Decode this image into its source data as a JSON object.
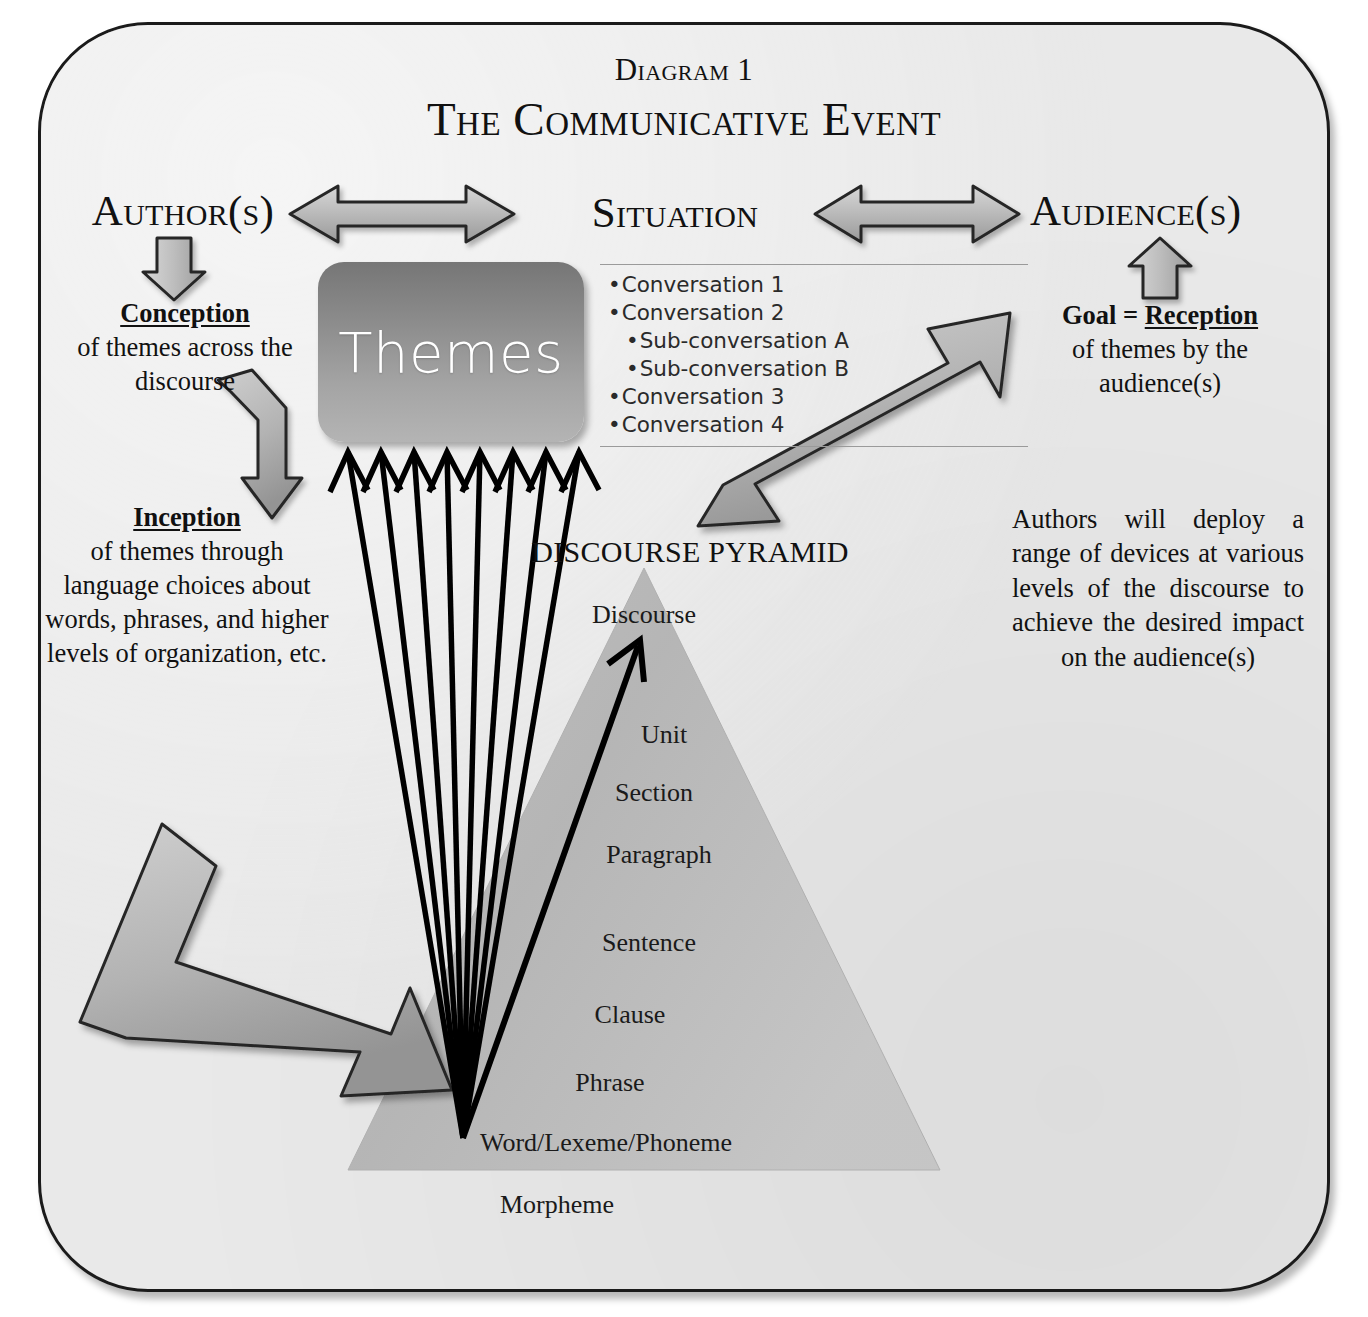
{
  "figure": {
    "number_label": "Diagram 1",
    "title": "The Communicative Event"
  },
  "columns": {
    "author_heading": "Author(s)",
    "situation_heading": "Situation",
    "audience_heading": "Audience(s)"
  },
  "left_column": {
    "conception": {
      "keyword": "Conception",
      "body": "of themes across the discourse"
    },
    "inception": {
      "keyword": "Inception",
      "body": "of themes through language choices about words, phrases, and higher levels of organization, etc."
    }
  },
  "right_column": {
    "goal": {
      "prefix": "Goal = ",
      "keyword": "Reception",
      "body": "of themes by the audience(s)"
    },
    "note": "Authors will deploy a range of devices at various levels of the discourse to achieve the desired impact on the audience(s)"
  },
  "situation_list": [
    {
      "text": "Conversation 1",
      "level": 1
    },
    {
      "text": "Conversation 2",
      "level": 1
    },
    {
      "text": "Sub-conversation A",
      "level": 2
    },
    {
      "text": "Sub-conversation B",
      "level": 2
    },
    {
      "text": "Conversation 3",
      "level": 1
    },
    {
      "text": "Conversation 4",
      "level": 1
    }
  ],
  "themes_box": {
    "label": "Themes"
  },
  "pyramid": {
    "title": "DISCOURSE PYRAMID",
    "levels": [
      "Discourse",
      "Unit",
      "Section",
      "Paragraph",
      "Sentence",
      "Clause",
      "Phrase",
      "Word/Lexeme/Phoneme",
      "Morpheme"
    ]
  },
  "colors": {
    "page_background": "#ffffff",
    "panel_background": "#e9e9e9",
    "frame_stroke": "#1b1b1b",
    "arrow_fill_light": "#c2c2c2",
    "arrow_fill_dark": "#8f8f8f",
    "arrow_stroke": "#262626",
    "pyramid_fill": "#b7b7b7",
    "themes_top": "#767676",
    "themes_bottom": "#b4b4b4",
    "thin_arrow": "#000000",
    "rule_line": "#9a9a9a"
  },
  "icons": {
    "double_arrow_left": "double-headed-arrow-icon",
    "double_arrow_right": "double-headed-arrow-icon",
    "author_down_arrow": "down-arrow-icon",
    "audience_up_arrow": "up-arrow-icon",
    "conception_bent_arrow": "bent-arrow-icon",
    "inception_bent_arrow": "bent-arrow-icon",
    "reception_diagonal_arrow": "diagonal-arrow-icon"
  }
}
